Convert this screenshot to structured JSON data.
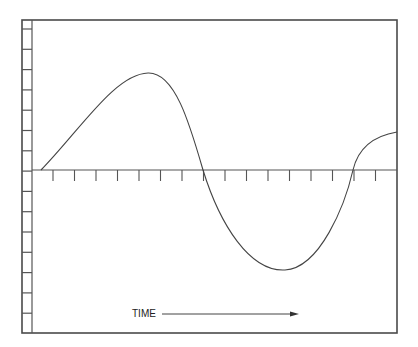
{
  "diagram": {
    "title": "",
    "x_axis_label": "TIME",
    "x_axis_arrow": "right-arrow",
    "horizontal_axis_ticks": 16,
    "vertical_ruler_ticks": 15,
    "waveform": {
      "description": "oscillating wave starting at zero, rising to a positive peak, crossing zero, dipping to a negative trough, and rising again",
      "points": [
        {
          "t": 0.0,
          "v": 0.0
        },
        {
          "t": 0.15,
          "v": 0.55
        },
        {
          "t": 0.31,
          "v": 0.97
        },
        {
          "t": 0.45,
          "v": 0.0
        },
        {
          "t": 0.68,
          "v": -1.0
        },
        {
          "t": 0.87,
          "v": 0.0
        },
        {
          "t": 1.0,
          "v": 0.38
        }
      ]
    }
  },
  "colors": {
    "line": "#444444",
    "background": "#ffffff"
  }
}
